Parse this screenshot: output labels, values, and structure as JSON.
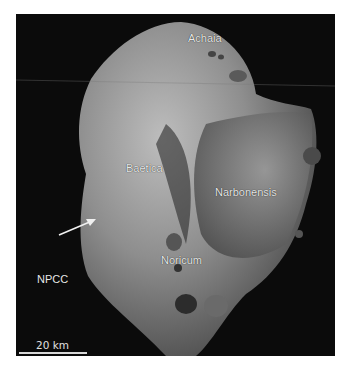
{
  "figure": {
    "regions": [
      {
        "name": "Achaia"
      },
      {
        "name": "Baetica"
      },
      {
        "name": "Narbonensis"
      },
      {
        "name": "Noricum"
      }
    ],
    "feature_label": "NPCC",
    "scale_bar": {
      "label": "20 km"
    },
    "colors": {
      "background": "#0b0b0b",
      "label": "#e8e8e8"
    }
  }
}
